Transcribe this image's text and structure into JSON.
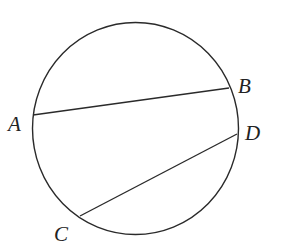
{
  "diagram": {
    "type": "circle-with-chords",
    "stroke_color": "#2a2a2a",
    "background": "#ffffff",
    "circle": {
      "cx": 135.5,
      "cy": 128.5,
      "rx": 103,
      "ry": 106
    },
    "points": {
      "A": {
        "x": 33,
        "y": 115,
        "label": "A",
        "label_x": 8,
        "label_y": 131
      },
      "B": {
        "x": 229,
        "y": 88,
        "label": "B",
        "label_x": 238,
        "label_y": 93
      },
      "C": {
        "x": 80,
        "y": 216,
        "label": "C",
        "label_x": 54,
        "label_y": 241
      },
      "D": {
        "x": 237,
        "y": 134,
        "label": "D",
        "label_x": 245,
        "label_y": 140
      }
    },
    "chords": [
      {
        "from": "A",
        "to": "B"
      },
      {
        "from": "C",
        "to": "D"
      }
    ]
  }
}
